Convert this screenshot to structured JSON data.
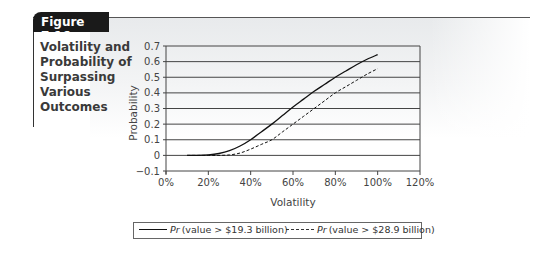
{
  "figure": {
    "label": "Figure 7.16",
    "caption_lines": [
      "Volatility and",
      "Probability of",
      "Surpassing",
      "Various",
      "Outcomes"
    ]
  },
  "legend": {
    "items": [
      {
        "prefix": "Pr",
        "text": "(value > $19.3 billion)",
        "style": "solid"
      },
      {
        "prefix": "Pr",
        "text": "(value > $28.9 billion)",
        "style": "dashed"
      }
    ]
  },
  "chart_data": {
    "type": "line",
    "title": "Volatility and Probability of Surpassing Various Outcomes",
    "xlabel": "Volatility",
    "ylabel": "Probability",
    "xlim": [
      0,
      120
    ],
    "ylim": [
      -0.1,
      0.7
    ],
    "x_ticks": [
      "0%",
      "20%",
      "40%",
      "60%",
      "80%",
      "100%",
      "120%"
    ],
    "y_ticks": [
      "0.7",
      "0.6",
      "0.5",
      "0.4",
      "0.3",
      "0.2",
      "0.1",
      "0",
      "−0.1"
    ],
    "y_tick_values": [
      0.7,
      0.6,
      0.5,
      0.4,
      0.3,
      0.2,
      0.1,
      0,
      -0.1
    ],
    "grid": "horizontal",
    "legend_position": "bottom",
    "series": [
      {
        "name": "Pr (value > $19.3 billion)",
        "style": "solid",
        "x": [
          10,
          15,
          20,
          25,
          30,
          35,
          40,
          45,
          50,
          55,
          60,
          65,
          70,
          75,
          80,
          85,
          90,
          95,
          100
        ],
        "values": [
          0.0,
          0.0,
          0.003,
          0.012,
          0.03,
          0.06,
          0.1,
          0.15,
          0.2,
          0.255,
          0.31,
          0.36,
          0.41,
          0.455,
          0.5,
          0.54,
          0.58,
          0.615,
          0.645
        ]
      },
      {
        "name": "Pr (value > $28.9 billion)",
        "style": "dashed",
        "x": [
          10,
          15,
          20,
          25,
          30,
          35,
          40,
          45,
          50,
          55,
          60,
          65,
          70,
          75,
          80,
          85,
          90,
          95,
          100
        ],
        "values": [
          0.0,
          0.0,
          0.0,
          0.0,
          0.003,
          0.015,
          0.04,
          0.07,
          0.1,
          0.15,
          0.2,
          0.25,
          0.3,
          0.35,
          0.4,
          0.44,
          0.48,
          0.52,
          0.555
        ]
      }
    ]
  }
}
